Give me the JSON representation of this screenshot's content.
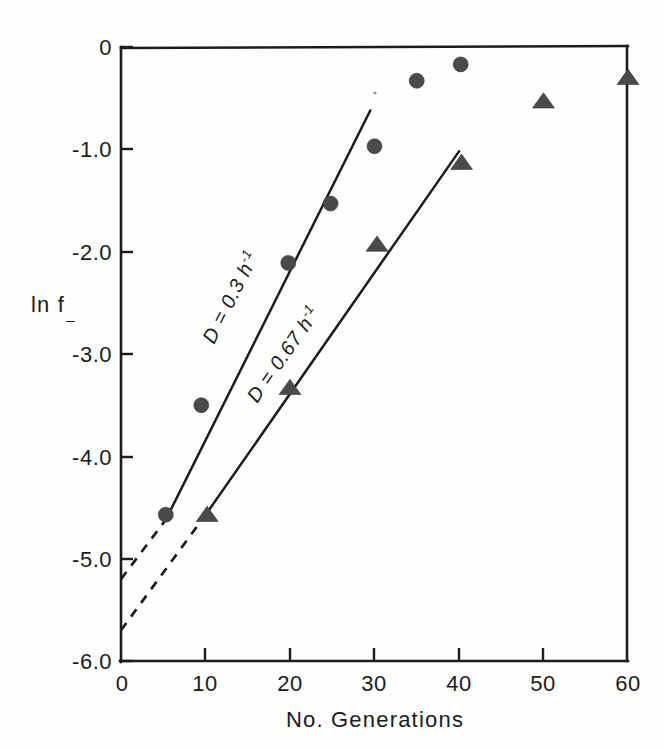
{
  "figure": {
    "background_color": "#fefefe",
    "ink_color": "#1c1c1c",
    "marker_color": "#4a4a4a"
  },
  "axes": {
    "y_title_main": "ln f",
    "y_title_sub": "_",
    "x_title": "No. Generations",
    "y_ticks": [
      "0",
      "-1.0",
      "-2.0",
      "-3.0",
      "-4.0",
      "-5.0",
      "-6.0"
    ],
    "x_ticks": [
      "0",
      "10",
      "20",
      "30",
      "40",
      "50",
      "60"
    ]
  },
  "annotations": {
    "line1_label_prefix": "D = 0.3 h",
    "line1_label_exponent": "-1",
    "line2_label_prefix": "D = 0.67 h",
    "line2_label_exponent": "-1"
  },
  "chart_data": {
    "type": "scatter",
    "title": "",
    "xlabel": "No. Generations",
    "ylabel": "ln f_",
    "xlim": [
      0,
      60
    ],
    "ylim": [
      -6.0,
      0.0
    ],
    "xticks": [
      0,
      10,
      20,
      30,
      40,
      50,
      60
    ],
    "yticks": [
      0,
      -1.0,
      -2.0,
      -3.0,
      -4.0,
      -5.0,
      -6.0
    ],
    "grid": false,
    "legend": "none",
    "series": [
      {
        "name": "D = 0.3 h^-1",
        "marker": "circle",
        "color": "#4a4a4a",
        "points": [
          {
            "x": 5.3,
            "y": -4.57
          },
          {
            "x": 9.5,
            "y": -3.5
          },
          {
            "x": 19.8,
            "y": -2.11
          },
          {
            "x": 24.8,
            "y": -1.53
          },
          {
            "x": 30.0,
            "y": -0.97
          },
          {
            "x": 35.0,
            "y": -0.33
          },
          {
            "x": 40.2,
            "y": -0.17
          }
        ],
        "fit_line": {
          "solid_from": {
            "x": 5.3,
            "y": -4.62
          },
          "solid_to": {
            "x": 29.5,
            "y": -0.62
          },
          "dashed_from": {
            "x": 0.0,
            "y": -5.2
          },
          "dashed_to": {
            "x": 5.3,
            "y": -4.62
          },
          "slope_per_generation": 0.165,
          "intercept": -5.2
        }
      },
      {
        "name": "D = 0.67 h^-1",
        "marker": "triangle",
        "color": "#4a4a4a",
        "points": [
          {
            "x": 10.2,
            "y": -4.57
          },
          {
            "x": 20.0,
            "y": -3.33
          },
          {
            "x": 30.3,
            "y": -1.93
          },
          {
            "x": 40.3,
            "y": -1.13
          },
          {
            "x": 50.0,
            "y": -0.53
          },
          {
            "x": 60.0,
            "y": -0.3
          }
        ],
        "fit_line": {
          "solid_from": {
            "x": 10.2,
            "y": -4.55
          },
          "solid_to": {
            "x": 40.0,
            "y": -1.02
          },
          "dashed_from": {
            "x": 0.0,
            "y": -5.7
          },
          "dashed_to": {
            "x": 10.2,
            "y": -4.55
          },
          "slope_per_generation": 0.1127,
          "intercept": -5.7
        }
      }
    ]
  }
}
